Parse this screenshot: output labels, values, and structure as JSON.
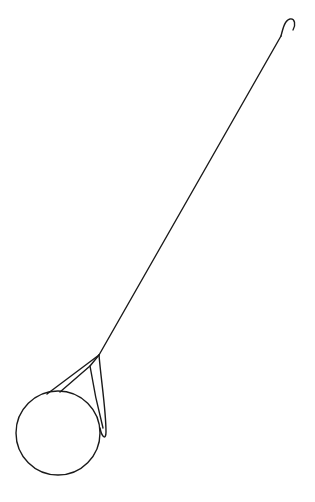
{
  "drawing": {
    "subject": "ball-on-wire-with-hook",
    "background_color": "#ffffff",
    "line_color": "#1a1a1a",
    "parts": [
      "hook",
      "wire",
      "loop",
      "ball"
    ]
  }
}
